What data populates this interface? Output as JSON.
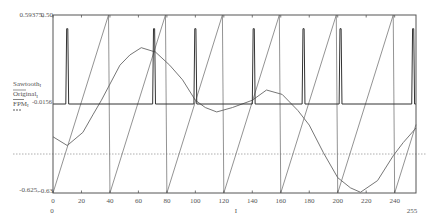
{
  "colors": {
    "frame": "#555555",
    "sawtooth": "#777777",
    "original": "#666666",
    "fpm": "#333333",
    "refline": "#999999"
  },
  "axes": {
    "y_outer_max": "0.59375",
    "y_marker_max": "0.50",
    "y_outer_min": "-0.625",
    "y_marker_min": "-0.63",
    "y_marker_mid": "-0.0156",
    "separator": ",",
    "x_min_label": "0",
    "x_max_label": "255",
    "x_var_label": "I",
    "x_ticks": [
      "0",
      "20",
      "40",
      "60",
      "80",
      "100",
      "120",
      "140",
      "160",
      "180",
      "200",
      "220",
      "240"
    ]
  },
  "legend": {
    "items": [
      {
        "name": "Sawtooth",
        "sub": "I"
      },
      {
        "name": "Original",
        "sub": "I"
      },
      {
        "name": "FPM",
        "sub": "I"
      }
    ]
  },
  "chart_data": {
    "type": "line",
    "title": "",
    "xlabel": "I",
    "ylabel": "Sawtooth_I, Original_I, FPM_I",
    "xlim": [
      0,
      255
    ],
    "ylim": [
      -0.625,
      0.59375
    ],
    "x_ticks": [
      0,
      20,
      40,
      60,
      80,
      100,
      120,
      140,
      160,
      180,
      200,
      220,
      240
    ],
    "y_markers": [
      0.5,
      -0.0156,
      -0.63
    ],
    "grid": false,
    "legend_position": "left",
    "reference_line": {
      "y": -0.36,
      "style": "dotted"
    },
    "series": [
      {
        "name": "Sawtooth_I",
        "description": "ramp of period 40 samples, step 0.03125 from -0.625 to 0.59375",
        "points": [
          [
            0,
            -0.625
          ],
          [
            39,
            0.59375
          ],
          [
            40,
            -0.625
          ],
          [
            79,
            0.59375
          ],
          [
            80,
            -0.625
          ],
          [
            119,
            0.59375
          ],
          [
            120,
            -0.625
          ],
          [
            159,
            0.59375
          ],
          [
            160,
            -0.625
          ],
          [
            199,
            0.59375
          ],
          [
            200,
            -0.625
          ],
          [
            239,
            0.59375
          ],
          [
            240,
            -0.625
          ],
          [
            255,
            -0.156
          ]
        ]
      },
      {
        "name": "Original_I",
        "points": [
          [
            0,
            -0.24
          ],
          [
            10,
            -0.3
          ],
          [
            21,
            -0.21
          ],
          [
            28,
            -0.09
          ],
          [
            34,
            0.01
          ],
          [
            47,
            0.25
          ],
          [
            54,
            0.32
          ],
          [
            62,
            0.37
          ],
          [
            72,
            0.34
          ],
          [
            82,
            0.25
          ],
          [
            91,
            0.15
          ],
          [
            100,
            0.01
          ],
          [
            107,
            -0.04
          ],
          [
            115,
            -0.07
          ],
          [
            126,
            -0.04
          ],
          [
            140,
            0.01
          ],
          [
            150,
            0.08
          ],
          [
            161,
            0.05
          ],
          [
            172,
            -0.06
          ],
          [
            180,
            -0.16
          ],
          [
            190,
            -0.35
          ],
          [
            200,
            -0.52
          ],
          [
            209,
            -0.59
          ],
          [
            216,
            -0.62
          ],
          [
            228,
            -0.54
          ],
          [
            239,
            -0.37
          ],
          [
            246,
            -0.28
          ],
          [
            255,
            -0.18
          ]
        ]
      },
      {
        "name": "FPM_I",
        "baseline": -0.0156,
        "peak": 0.5,
        "pulse_positions": [
          10,
          71,
          100,
          141,
          176,
          202,
          253
        ]
      }
    ]
  }
}
